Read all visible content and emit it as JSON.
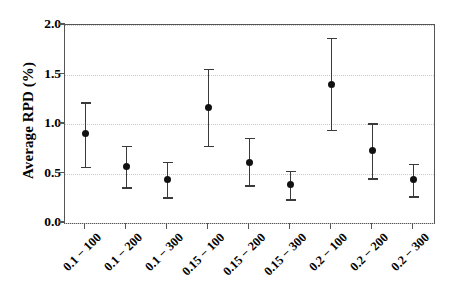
{
  "chart_data": {
    "type": "scatter",
    "title": "",
    "xlabel": "",
    "ylabel": "Average RPD (%)",
    "ylim": [
      0.0,
      2.0
    ],
    "yticks": [
      "0.0",
      "0.5",
      "1.0",
      "1.5",
      "2.0"
    ],
    "ytick_values": [
      0.0,
      0.5,
      1.0,
      1.5,
      2.0
    ],
    "grid": true,
    "grid_axis": "y",
    "legend": "none",
    "errorbars": true,
    "categories": [
      "0.1 − 100",
      "0.1 − 200",
      "0.1 − 300",
      "0.15 − 100",
      "0.15 − 200",
      "0.15 − 300",
      "0.2 − 100",
      "0.2 − 200",
      "0.2 − 300"
    ],
    "values": [
      0.9,
      0.57,
      0.44,
      1.17,
      0.61,
      0.39,
      1.4,
      0.73,
      0.44
    ],
    "err_low": [
      0.57,
      0.36,
      0.26,
      0.78,
      0.38,
      0.24,
      0.94,
      0.45,
      0.27
    ],
    "err_high": [
      1.22,
      0.78,
      0.62,
      1.56,
      0.86,
      0.53,
      1.87,
      1.01,
      0.6
    ],
    "series": [
      {
        "name": "Average RPD",
        "values": [
          0.9,
          0.57,
          0.44,
          1.17,
          0.61,
          0.39,
          1.4,
          0.73,
          0.44
        ]
      }
    ],
    "marker": "filled-circle",
    "marker_color": "#111111",
    "errorbar_color": "#3a3a3a",
    "grid_color": "#c9c9c9",
    "frame_color": "#555555",
    "background_color": "#ffffff"
  }
}
